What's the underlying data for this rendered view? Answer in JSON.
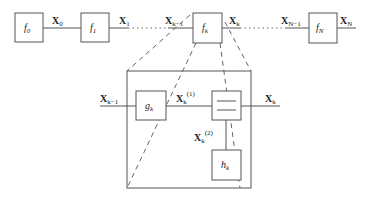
{
  "top_chain": {
    "blocks": [
      {
        "name": "f",
        "sub": "0"
      },
      {
        "name": "f",
        "sub": "1"
      },
      {
        "name": "f",
        "sub": "k"
      },
      {
        "name": "f",
        "sub": "N"
      }
    ],
    "signals": [
      {
        "name": "X",
        "sub": "0"
      },
      {
        "name": "X",
        "sub": "1"
      },
      {
        "name": "X",
        "sub": "k−1"
      },
      {
        "name": "X",
        "sub": "k"
      },
      {
        "name": "X",
        "sub": "N−1"
      },
      {
        "name": "X",
        "sub": "N"
      }
    ]
  },
  "detail": {
    "input": {
      "name": "X",
      "sub": "k−1"
    },
    "g_block": {
      "name": "g",
      "sub": "k"
    },
    "mid_signal": {
      "name": "X",
      "sub": "k",
      "sup": "(1)"
    },
    "output": {
      "name": "X",
      "sub": "k"
    },
    "branch_signal": {
      "name": "X",
      "sub": "k",
      "sup": "(2)"
    },
    "h_block": {
      "name": "h",
      "sub": "k"
    }
  }
}
